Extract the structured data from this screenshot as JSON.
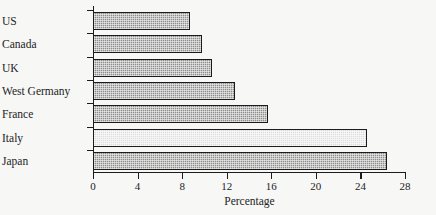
{
  "chart_data": {
    "type": "bar",
    "orientation": "horizontal",
    "title": "",
    "xlabel": "Percentage",
    "ylabel": "",
    "categories": [
      "US",
      "Canada",
      "UK",
      "West Germany",
      "France",
      "Italy",
      "Japan"
    ],
    "values": [
      8.7,
      9.8,
      10.7,
      12.7,
      15.7,
      24.6,
      26.4
    ],
    "xlim": [
      0,
      28
    ],
    "xticks": [
      0,
      4,
      8,
      12,
      16,
      20,
      24,
      28
    ],
    "xtick_labels": [
      "0",
      "4",
      "8",
      "12",
      "16",
      "20",
      "24",
      "28"
    ],
    "grid": false,
    "legend": null,
    "bar_styles": [
      "hatched-dark",
      "hatched-dark",
      "hatched-dark",
      "hatched-dark",
      "hatched-dark",
      "hatched-light",
      "hatched-dark"
    ],
    "colors": {
      "bar_fill_dark": "#8d8d8d",
      "bar_fill_light": "#dedede",
      "bar_edge": "#1c1c1c",
      "axis": "#1c1c1c",
      "text": "#232323",
      "background": "#f7f7f6"
    }
  }
}
